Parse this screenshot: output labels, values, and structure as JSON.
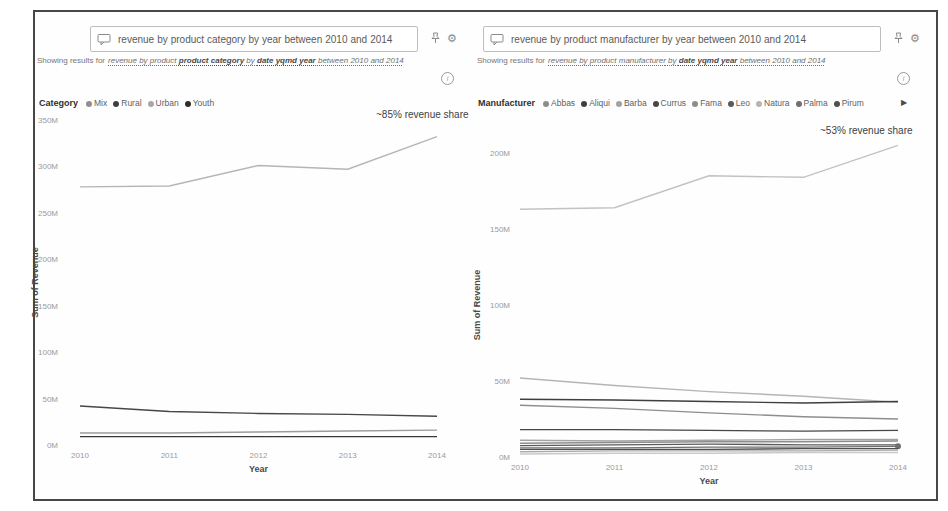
{
  "icons": {
    "gear_glyph": "⚙",
    "info_glyph": "i",
    "legend_arrow_glyph": "▶"
  },
  "panels": [
    {
      "id": "category",
      "search": {
        "query": "revenue by product category by year between 2010 and 2014",
        "tokens": [
          {
            "text": "revenue",
            "u": true
          },
          {
            "text": "by",
            "u": false
          },
          {
            "text": "product",
            "u": true
          },
          {
            "text": "category",
            "u": true
          },
          {
            "text": "by",
            "u": false
          },
          {
            "text": "year",
            "u": true
          },
          {
            "text": "between",
            "u": true
          },
          {
            "text": "2010",
            "u": true
          },
          {
            "text": "and",
            "u": true
          },
          {
            "text": "2014",
            "u": true
          }
        ]
      },
      "showing_results": {
        "prefix": "Showing results for",
        "segments": [
          {
            "text": "revenue by product ",
            "bold": false
          },
          {
            "text": "product category",
            "bold": true
          },
          {
            "text": " by ",
            "bold": false
          },
          {
            "text": "date yqmd year",
            "bold": true
          },
          {
            "text": " between 2010 and 2014",
            "bold": false
          }
        ]
      },
      "legend": {
        "title": "Category",
        "items": [
          {
            "label": "Mix",
            "color": "#8f8f8f"
          },
          {
            "label": "Rural",
            "color": "#3f3f3f"
          },
          {
            "label": "Urban",
            "color": "#a8a8a8"
          },
          {
            "label": "Youth",
            "color": "#2d2d2d"
          }
        ]
      },
      "annotation": "~85% revenue share"
    },
    {
      "id": "manufacturer",
      "search": {
        "query": "revenue by product manufacturer by year between 2010 and 2014",
        "tokens": [
          {
            "text": "revenue",
            "u": true
          },
          {
            "text": "by",
            "u": false
          },
          {
            "text": "product",
            "u": true
          },
          {
            "text": "manufacturer",
            "u": true
          },
          {
            "text": "by",
            "u": false
          },
          {
            "text": "year",
            "u": true
          },
          {
            "text": "between",
            "u": true
          },
          {
            "text": "2010",
            "u": true
          },
          {
            "text": "and",
            "u": true
          },
          {
            "text": "2014",
            "u": true
          }
        ]
      },
      "showing_results": {
        "prefix": "Showing results for",
        "segments": [
          {
            "text": "revenue by product manufacturer",
            "bold": false
          },
          {
            "text": " by ",
            "bold": false
          },
          {
            "text": "date yqmd year",
            "bold": true
          },
          {
            "text": " between 2010 and 2014",
            "bold": false
          }
        ]
      },
      "legend": {
        "title": "Manufacturer",
        "items": [
          {
            "label": "Abbas",
            "color": "#8d8d8d"
          },
          {
            "label": "Aliqui",
            "color": "#3f3f3f"
          },
          {
            "label": "Barba",
            "color": "#a3a3a3"
          },
          {
            "label": "Currus",
            "color": "#474747"
          },
          {
            "label": "Fama",
            "color": "#8d8d8d"
          },
          {
            "label": "Leo",
            "color": "#5a5a5a"
          },
          {
            "label": "Natura",
            "color": "#b5b5b5"
          },
          {
            "label": "Palma",
            "color": "#707070"
          },
          {
            "label": "Pirum",
            "color": "#4f4f4f"
          }
        ],
        "overflow_arrow": true
      },
      "annotation": "~53% revenue share"
    }
  ],
  "chart_data": [
    {
      "type": "line",
      "title": "",
      "x": [
        2010,
        2011,
        2012,
        2013,
        2014
      ],
      "xlabel": "Year",
      "ylabel": "Sum of Revenue",
      "ylim": [
        0,
        350
      ],
      "units": "millions (M)",
      "grid": false,
      "legend_position": "top",
      "ytick_labels": [
        "0M",
        "50M",
        "100M",
        "150M",
        "200M",
        "250M",
        "300M",
        "350M"
      ],
      "annotation": "~85% revenue share",
      "series": [
        {
          "name": "Urban",
          "color": "#b5b5b5",
          "values": [
            278,
            279,
            301,
            297,
            332
          ]
        },
        {
          "name": "Rural",
          "color": "#474747",
          "values": [
            42,
            36,
            34,
            33,
            31
          ]
        },
        {
          "name": "Mix",
          "color": "#9c9c9c",
          "values": [
            13,
            13,
            14,
            15,
            16
          ]
        },
        {
          "name": "Youth",
          "color": "#383838",
          "values": [
            9,
            9,
            9,
            9,
            9
          ]
        }
      ]
    },
    {
      "type": "line",
      "title": "",
      "x": [
        2010,
        2011,
        2012,
        2013,
        2014
      ],
      "xlabel": "Year",
      "ylabel": "Sum of Revenue",
      "ylim": [
        0,
        200
      ],
      "units": "millions (M)",
      "grid": false,
      "legend_position": "top",
      "ytick_labels": [
        "0M",
        "50M",
        "100M",
        "150M",
        "200M"
      ],
      "annotation": "~53% revenue share",
      "series": [
        {
          "name": "",
          "color": "#c2c2c2",
          "values": [
            163,
            164,
            185,
            184,
            205
          ]
        },
        {
          "name": "Natura",
          "color": "#b5b5b5",
          "values": [
            52,
            47,
            43,
            40,
            36
          ]
        },
        {
          "name": "Aliqui",
          "color": "#3f3f3f",
          "values": [
            38,
            37.5,
            36.5,
            35.5,
            36.5
          ]
        },
        {
          "name": "Abbas",
          "color": "#8d8d8d",
          "values": [
            34,
            32,
            29,
            26.5,
            25
          ]
        },
        {
          "name": "Currus",
          "color": "#474747",
          "values": [
            18,
            18,
            17.5,
            17,
            17.5
          ]
        },
        {
          "name": "Barba",
          "color": "#a3a3a3",
          "values": [
            11,
            10.5,
            11,
            11.5,
            11.5
          ]
        },
        {
          "name": "Fama",
          "color": "#8d8d8d",
          "values": [
            9,
            9.5,
            10,
            10,
            10.5
          ]
        },
        {
          "name": "Leo",
          "color": "#5a5a5a",
          "values": [
            7.5,
            8,
            8.5,
            8,
            8
          ]
        },
        {
          "name": "Palma",
          "color": "#707070",
          "values": [
            6,
            6,
            6.5,
            6.5,
            7
          ],
          "end_marker": true
        },
        {
          "name": "Pirum",
          "color": "#4f4f4f",
          "values": [
            5,
            5,
            5,
            5.5,
            5.5
          ]
        },
        {
          "name": "",
          "color": "#ababab",
          "values": [
            3.5,
            4,
            4,
            4,
            4.5
          ]
        },
        {
          "name": "",
          "color": "#c9c9c9",
          "values": [
            2,
            2.5,
            2.5,
            3,
            3
          ]
        }
      ]
    }
  ]
}
